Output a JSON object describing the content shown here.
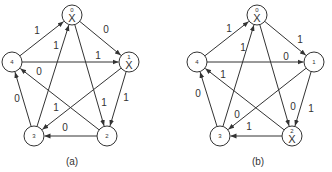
{
  "panels": [
    {
      "id": "a",
      "caption": "(a)",
      "offset_x": 0,
      "nodes": [
        {
          "id": "0",
          "x": 72,
          "y": 15,
          "marked": true
        },
        {
          "id": "1",
          "x": 129,
          "y": 62,
          "marked": true
        },
        {
          "id": "2",
          "x": 107,
          "y": 136,
          "marked": false
        },
        {
          "id": "3",
          "x": 34,
          "y": 136,
          "marked": false
        },
        {
          "id": "4",
          "x": 12,
          "y": 62,
          "marked": false
        }
      ],
      "edges": [
        {
          "from": "4",
          "to": "0",
          "label": "1",
          "lx": 37,
          "ly": 34
        },
        {
          "from": "0",
          "to": "1",
          "label": "0",
          "lx": 106,
          "ly": 33
        },
        {
          "from": "4",
          "to": "1",
          "label": "1",
          "lx": 98,
          "ly": 59
        },
        {
          "from": "3",
          "to": "0",
          "label": "1",
          "lx": 56,
          "ly": 49
        },
        {
          "from": "0",
          "to": "2",
          "label": "1",
          "lx": 104,
          "ly": 106
        },
        {
          "from": "1",
          "to": "2",
          "label": "1",
          "lx": 126,
          "ly": 101
        },
        {
          "from": "1",
          "to": "3",
          "label": "1",
          "lx": 56,
          "ly": 111
        },
        {
          "from": "2",
          "to": "4",
          "label": "0",
          "lx": 39,
          "ly": 75
        },
        {
          "from": "3",
          "to": "4",
          "label": "0",
          "lx": 17,
          "ly": 102
        },
        {
          "from": "2",
          "to": "3",
          "label": "0",
          "lx": 65,
          "ly": 131
        }
      ]
    },
    {
      "id": "b",
      "caption": "(b)",
      "offset_x": 0,
      "nodes": [
        {
          "id": "0",
          "x": 257,
          "y": 15,
          "marked": true
        },
        {
          "id": "1",
          "x": 314,
          "y": 62,
          "marked": false
        },
        {
          "id": "2",
          "x": 292,
          "y": 136,
          "marked": true
        },
        {
          "id": "3",
          "x": 220,
          "y": 136,
          "marked": false
        },
        {
          "id": "4",
          "x": 197,
          "y": 62,
          "marked": false
        }
      ],
      "edges": [
        {
          "from": "4",
          "to": "0",
          "label": "1",
          "lx": 229,
          "ly": 32
        },
        {
          "from": "0",
          "to": "1",
          "label": "1",
          "lx": 300,
          "ly": 43
        },
        {
          "from": "4",
          "to": "1",
          "label": "0",
          "lx": 286,
          "ly": 60
        },
        {
          "from": "3",
          "to": "0",
          "label": "1",
          "lx": 243,
          "ly": 51
        },
        {
          "from": "0",
          "to": "2",
          "label": "0",
          "lx": 293,
          "ly": 110
        },
        {
          "from": "1",
          "to": "2",
          "label": "1",
          "lx": 311,
          "ly": 112
        },
        {
          "from": "1",
          "to": "3",
          "label": "0",
          "lx": 237,
          "ly": 118
        },
        {
          "from": "2",
          "to": "4",
          "label": "1",
          "lx": 223,
          "ly": 78
        },
        {
          "from": "3",
          "to": "4",
          "label": "0",
          "lx": 198,
          "ly": 97
        },
        {
          "from": "2",
          "to": "3",
          "label": "1",
          "lx": 249,
          "ly": 130
        }
      ]
    }
  ],
  "captions": {
    "a": "(a)",
    "b": "(b)"
  },
  "mark_symbol": "X",
  "node_radius": 10
}
